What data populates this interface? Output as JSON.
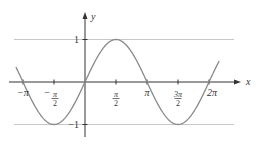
{
  "chart_data": {
    "type": "line",
    "title": "",
    "xlabel": "x",
    "ylabel": "y",
    "function": "sin(x)",
    "xlim": [
      -3.5,
      7.0
    ],
    "ylim": [
      -1.2,
      1.6
    ],
    "x_ticks": [
      {
        "value": -3.14159,
        "label": "−π"
      },
      {
        "value": -1.5708,
        "label": "−π/2"
      },
      {
        "value": 1.5708,
        "label": "π/2"
      },
      {
        "value": 3.14159,
        "label": "π"
      },
      {
        "value": 4.71239,
        "label": "3π/2"
      },
      {
        "value": 6.28319,
        "label": "2π"
      }
    ],
    "y_ticks": [
      {
        "value": 1,
        "label": "1"
      },
      {
        "value": -1,
        "label": "−1"
      }
    ],
    "reference_lines": [
      {
        "type": "horizontal",
        "value": 1
      },
      {
        "type": "horizontal",
        "value": -1
      }
    ],
    "series": [
      {
        "name": "y = sin x",
        "x": [
          -3.5,
          -3.14159,
          -1.5708,
          0,
          1.5708,
          3.14159,
          4.71239,
          6.28319,
          6.8
        ],
        "values": [
          0.351,
          0,
          -1,
          0,
          1,
          0,
          -1,
          0,
          0.494
        ]
      }
    ],
    "grid": false,
    "legend": null,
    "colors": {
      "curve": "#8a8a8a",
      "axes": "#333333",
      "reflines": "#c8c8c8"
    }
  }
}
